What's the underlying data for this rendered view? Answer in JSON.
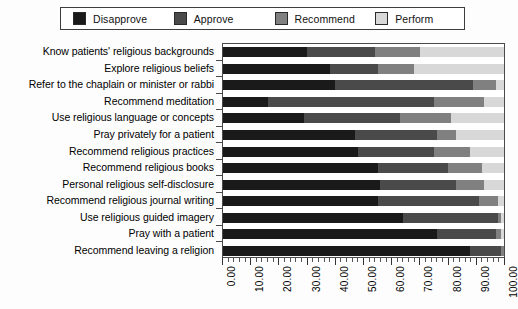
{
  "chart_data": {
    "type": "bar",
    "orientation": "horizontal",
    "stacked": true,
    "title": "",
    "xlabel": "",
    "ylabel": "",
    "xlim": [
      0,
      100
    ],
    "xticks": [
      "0.00",
      "10.00",
      "20.00",
      "30.00",
      "40.00",
      "50.00",
      "60.00",
      "70.00",
      "80.00",
      "90.00",
      "100.00"
    ],
    "grid": false,
    "legend_position": "top",
    "categories": [
      "Know patients' religious backgrounds",
      "Explore religious beliefs",
      "Refer to the chaplain or minister or rabbi",
      "Recommend meditation",
      "Use religious language or concepts",
      "Pray privately for a patient",
      "Recommend religious practices",
      "Recommend religious books",
      "Personal religious self-disclosure",
      "Recommend religious journal writing",
      "Use religious guided imagery",
      "Pray with a patient",
      "Recommend leaving a religion"
    ],
    "series": [
      {
        "name": "Disapprove",
        "color": "#1a1a1a",
        "values": [
          30.0,
          38.0,
          40.0,
          16.0,
          29.0,
          47.0,
          48.0,
          55.0,
          56.0,
          55.0,
          64.0,
          76.0,
          88.0
        ]
      },
      {
        "name": "Approve",
        "color": "#4a4a4a",
        "values": [
          24.0,
          17.0,
          49.0,
          59.0,
          34.0,
          29.0,
          27.0,
          25.0,
          27.0,
          36.0,
          34.0,
          21.0,
          11.0
        ]
      },
      {
        "name": "Recommend",
        "color": "#808080",
        "values": [
          16.0,
          13.0,
          8.0,
          18.0,
          18.0,
          7.0,
          13.0,
          12.0,
          10.0,
          7.0,
          1.0,
          2.0,
          1.0
        ]
      },
      {
        "name": "Perform",
        "color": "#d8d8d8",
        "values": [
          30.0,
          32.0,
          3.0,
          7.0,
          19.0,
          17.0,
          12.0,
          8.0,
          7.0,
          2.0,
          1.0,
          1.0,
          0.0
        ]
      }
    ]
  },
  "legend": {
    "items": [
      {
        "label": "Disapprove",
        "color": "#1a1a1a"
      },
      {
        "label": "Approve",
        "color": "#4a4a4a"
      },
      {
        "label": "Recommend",
        "color": "#808080"
      },
      {
        "label": "Perform",
        "color": "#d8d8d8"
      }
    ]
  }
}
